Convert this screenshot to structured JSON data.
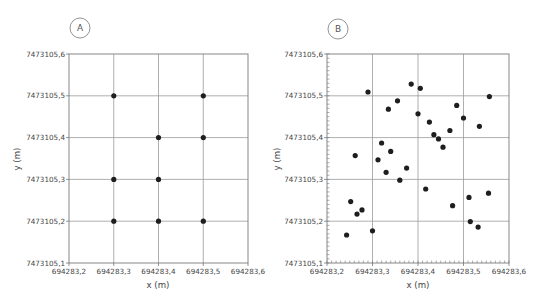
{
  "chart_data": [
    {
      "panel": "A",
      "type": "scatter",
      "title": "",
      "xlabel": "x (m)",
      "ylabel": "y (m)",
      "xlim": [
        694283.2,
        694283.6
      ],
      "ylim": [
        7473105.1,
        7473105.6
      ],
      "x_ticks": [
        "694283,2",
        "694283,3",
        "694283,4",
        "694283,5",
        "694283,6"
      ],
      "y_ticks": [
        "7473105,1",
        "7473105,2",
        "7473105,3",
        "7473105,4",
        "7473105,5",
        "7473105,6"
      ],
      "grid": true,
      "minor_ticks": false,
      "points": [
        {
          "x": 694283.3,
          "y": 7473105.5
        },
        {
          "x": 694283.5,
          "y": 7473105.5
        },
        {
          "x": 694283.4,
          "y": 7473105.4
        },
        {
          "x": 694283.5,
          "y": 7473105.4
        },
        {
          "x": 694283.3,
          "y": 7473105.3
        },
        {
          "x": 694283.4,
          "y": 7473105.3
        },
        {
          "x": 694283.3,
          "y": 7473105.2
        },
        {
          "x": 694283.4,
          "y": 7473105.2
        },
        {
          "x": 694283.5,
          "y": 7473105.2
        }
      ]
    },
    {
      "panel": "B",
      "type": "scatter",
      "title": "",
      "xlabel": "x (m)",
      "ylabel": "y (m)",
      "xlim": [
        694283.2,
        694283.6
      ],
      "ylim": [
        7473105.1,
        7473105.6
      ],
      "x_ticks": [
        "694283,2",
        "694283,3",
        "694283,4",
        "694283,5",
        "694283,6"
      ],
      "y_ticks": [
        "7473105,1",
        "7473105,2",
        "7473105,3",
        "7473105,4",
        "7473105,5",
        "7473105,6"
      ],
      "grid": true,
      "minor_ticks": true,
      "points": [
        {
          "x": 694283.29,
          "y": 7473105.509
        },
        {
          "x": 694283.385,
          "y": 7473105.528
        },
        {
          "x": 694283.405,
          "y": 7473105.518
        },
        {
          "x": 694283.355,
          "y": 7473105.488
        },
        {
          "x": 694283.335,
          "y": 7473105.468
        },
        {
          "x": 694283.4,
          "y": 7473105.457
        },
        {
          "x": 694283.557,
          "y": 7473105.498
        },
        {
          "x": 694283.485,
          "y": 7473105.477
        },
        {
          "x": 694283.5,
          "y": 7473105.447
        },
        {
          "x": 694283.425,
          "y": 7473105.437
        },
        {
          "x": 694283.535,
          "y": 7473105.427
        },
        {
          "x": 694283.47,
          "y": 7473105.417
        },
        {
          "x": 694283.435,
          "y": 7473105.407
        },
        {
          "x": 694283.445,
          "y": 7473105.397
        },
        {
          "x": 694283.455,
          "y": 7473105.377
        },
        {
          "x": 694283.32,
          "y": 7473105.387
        },
        {
          "x": 694283.34,
          "y": 7473105.367
        },
        {
          "x": 694283.262,
          "y": 7473105.357
        },
        {
          "x": 694283.312,
          "y": 7473105.347
        },
        {
          "x": 694283.375,
          "y": 7473105.327
        },
        {
          "x": 694283.33,
          "y": 7473105.317
        },
        {
          "x": 694283.36,
          "y": 7473105.298
        },
        {
          "x": 694283.417,
          "y": 7473105.277
        },
        {
          "x": 694283.555,
          "y": 7473105.267
        },
        {
          "x": 694283.512,
          "y": 7473105.257
        },
        {
          "x": 694283.252,
          "y": 7473105.247
        },
        {
          "x": 694283.476,
          "y": 7473105.237
        },
        {
          "x": 694283.277,
          "y": 7473105.227
        },
        {
          "x": 694283.266,
          "y": 7473105.217
        },
        {
          "x": 694283.515,
          "y": 7473105.199
        },
        {
          "x": 694283.532,
          "y": 7473105.186
        },
        {
          "x": 694283.3,
          "y": 7473105.177
        },
        {
          "x": 694283.243,
          "y": 7473105.167
        }
      ]
    }
  ],
  "panels": [
    {
      "label": "A"
    },
    {
      "label": "B"
    }
  ]
}
